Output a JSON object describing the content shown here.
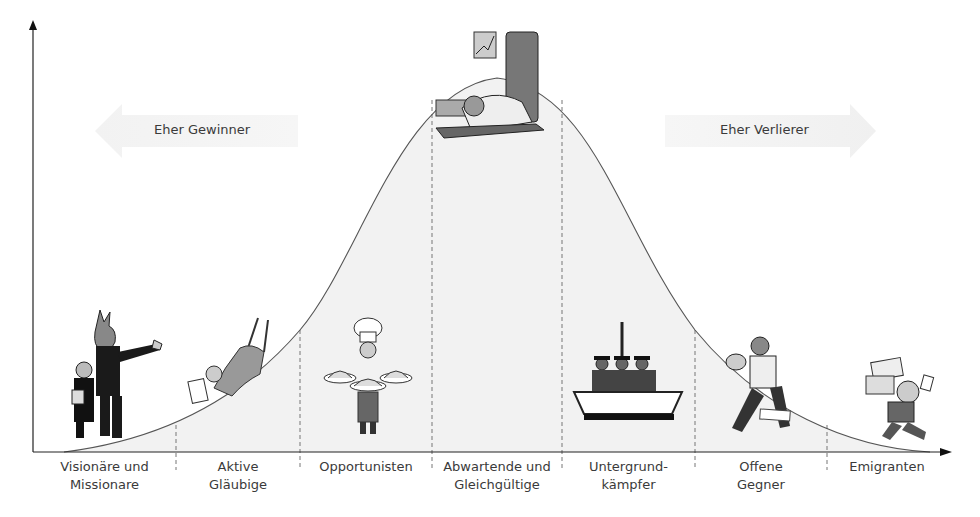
{
  "diagram": {
    "type": "bell-curve-segmentation",
    "left_arrow": {
      "label": "Eher Gewinner",
      "direction": "left"
    },
    "right_arrow": {
      "label": "Eher Verlierer",
      "direction": "right"
    },
    "segments": [
      {
        "line1": "Visionäre und",
        "line2": "Missionare",
        "illustration": "businessmen-pointing"
      },
      {
        "line1": "Aktive",
        "line2": "Gläubige",
        "illustration": "person-swinging-with-papers"
      },
      {
        "line1": "Opportunisten",
        "line2": "",
        "illustration": "chef-with-dishes"
      },
      {
        "line1": "Abwartende und",
        "line2": "Gleichgültige",
        "illustration": "person-asleep-at-desk"
      },
      {
        "line1": "Untergrund-",
        "line2": "kämpfer",
        "illustration": "men-in-hats-in-boat"
      },
      {
        "line1": "Offene",
        "line2": "Gegner",
        "illustration": "person-fighting-stance"
      },
      {
        "line1": "Emigranten",
        "line2": "",
        "illustration": "person-running-with-papers"
      }
    ],
    "colors": {
      "axis": "#222222",
      "curve": "#555555",
      "curve_fill": "#f0f0f0",
      "divider": "#777777",
      "arrow_band": "#ededed",
      "text": "#3a3a3a"
    }
  }
}
